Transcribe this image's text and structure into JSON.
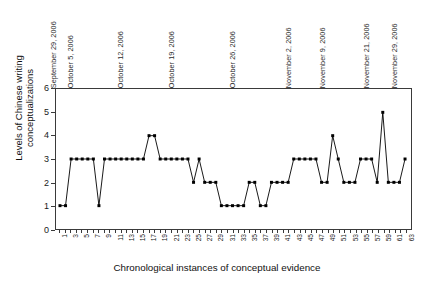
{
  "chart_data": {
    "type": "line",
    "title": "",
    "xlabel": "Chronological instances of conceptual evidence",
    "ylabel": "Levels of Chinese writing conceptualizations",
    "ylim": [
      0,
      6
    ],
    "yticks": [
      0,
      1,
      2,
      3,
      4,
      5,
      6
    ],
    "xlim": [
      1,
      63
    ],
    "grid": false,
    "legend": "none",
    "marker": "filled-square",
    "line_color": "#000000",
    "x": [
      1,
      2,
      3,
      4,
      5,
      6,
      7,
      8,
      9,
      10,
      11,
      12,
      13,
      14,
      15,
      16,
      17,
      18,
      19,
      20,
      21,
      22,
      23,
      24,
      25,
      26,
      27,
      28,
      29,
      30,
      31,
      32,
      33,
      34,
      35,
      36,
      37,
      38,
      39,
      40,
      41,
      42,
      43,
      44,
      45,
      46,
      47,
      48,
      49,
      50,
      51,
      52,
      53,
      54,
      55,
      56,
      57,
      58,
      59,
      60,
      61,
      62,
      63
    ],
    "xtick_labels": [
      "1",
      "3",
      "5",
      "7",
      "9",
      "11",
      "13",
      "15",
      "17",
      "19",
      "21",
      "23",
      "25",
      "27",
      "29",
      "31",
      "33",
      "35",
      "37",
      "39",
      "41",
      "43",
      "45",
      "47",
      "49",
      "51",
      "53",
      "55",
      "57",
      "59",
      "61",
      "63"
    ],
    "values": [
      1,
      1,
      3,
      3,
      3,
      3,
      3,
      1,
      3,
      3,
      3,
      3,
      3,
      3,
      3,
      3,
      4,
      4,
      3,
      3,
      3,
      3,
      3,
      3,
      2,
      3,
      2,
      2,
      2,
      1,
      1,
      1,
      1,
      1,
      2,
      2,
      1,
      1,
      2,
      2,
      2,
      2,
      3,
      3,
      3,
      3,
      3,
      2,
      2,
      4,
      3,
      2,
      2,
      2,
      3,
      3,
      3,
      2,
      5,
      2,
      2,
      2,
      3
    ],
    "annotations": [
      {
        "label": "September 29, 2006",
        "x": 1
      },
      {
        "label": "October 5, 2006",
        "x": 4
      },
      {
        "label": "October 12, 2006",
        "x": 13
      },
      {
        "label": "October 19, 2006",
        "x": 22
      },
      {
        "label": "October 26, 2006",
        "x": 33
      },
      {
        "label": "November 2, 2006",
        "x": 43
      },
      {
        "label": "November 9, 2006",
        "x": 49
      },
      {
        "label": "November 21, 2006",
        "x": 57
      },
      {
        "label": "November 29, 2006",
        "x": 62
      }
    ]
  }
}
